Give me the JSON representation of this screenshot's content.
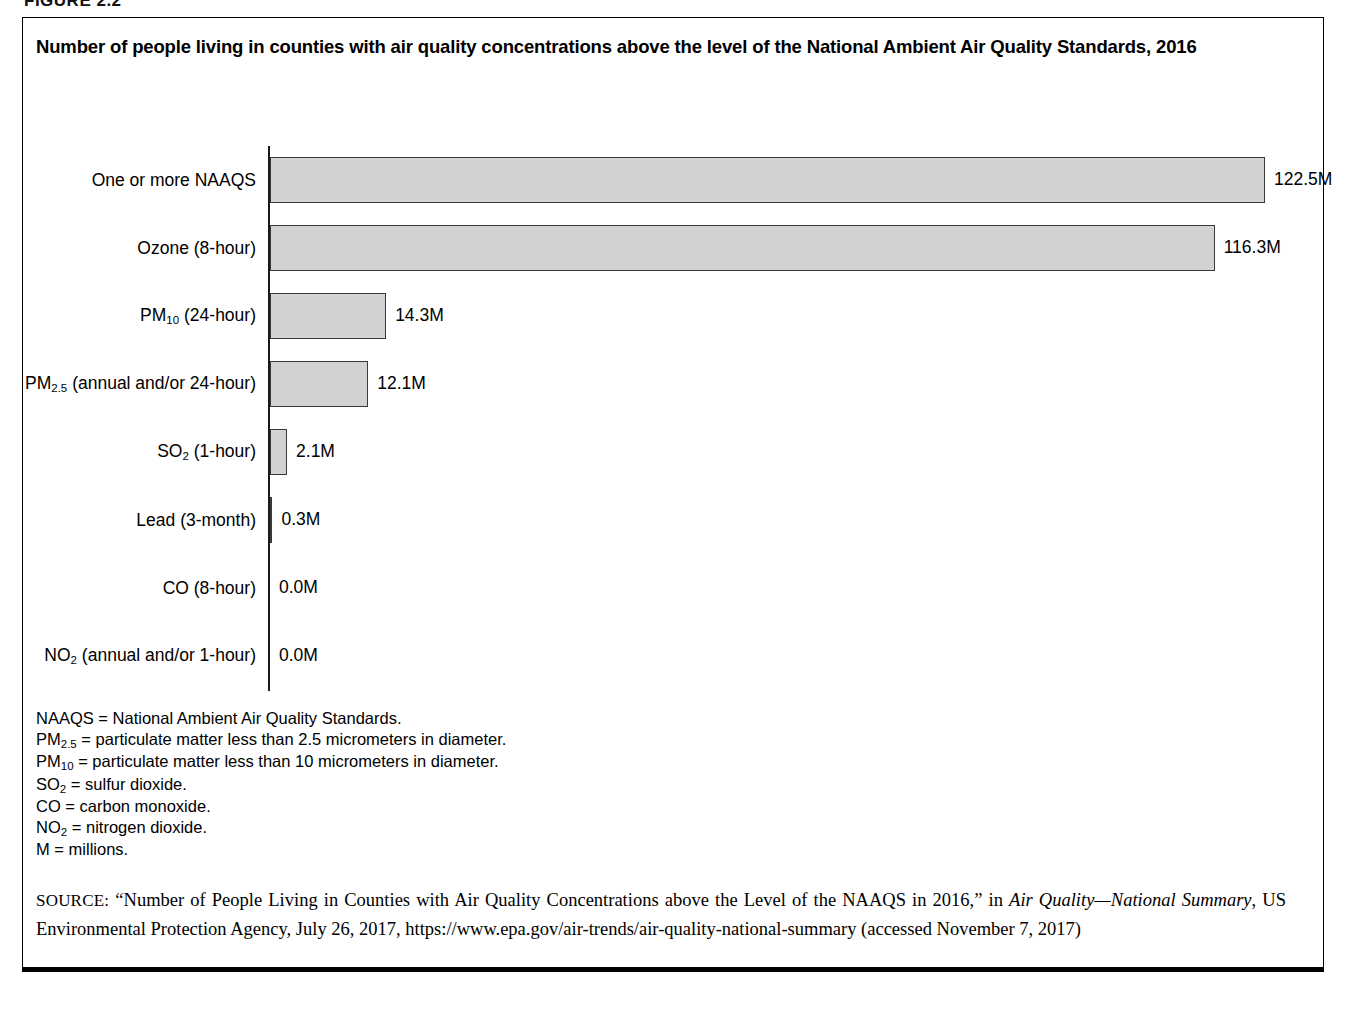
{
  "figure": {
    "caption": "FIGURE 2.2"
  },
  "chart_title": "Number of people living in counties with air quality concentrations above the level of the National Ambient Air Quality Standards, 2016",
  "chart_data": {
    "type": "bar",
    "orientation": "horizontal",
    "title": "Number of people living in counties with air quality concentrations above the level of the National Ambient Air Quality Standards, 2016",
    "xlabel": "",
    "ylabel": "",
    "xlim": [
      0,
      122.5
    ],
    "grid": false,
    "legend": "none",
    "unit": "millions of people",
    "categories": [
      "One or more NAAQS",
      "Ozone (8-hour)",
      "PM10 (24-hour)",
      "PM2.5 (annual and/or 24-hour)",
      "SO2 (1-hour)",
      "Lead (3-month)",
      "CO (8-hour)",
      "NO2 (annual and/or 1-hour)"
    ],
    "values": [
      122.5,
      116.3,
      14.3,
      12.1,
      2.1,
      0.3,
      0.0,
      0.0
    ],
    "value_labels": [
      "122.5M",
      "116.3M",
      "14.3M",
      "12.1M",
      "2.1M",
      "0.3M",
      "0.0M",
      "0.0M"
    ],
    "bars": [
      {
        "label_main": "One or more NAAQS",
        "label_sub": "",
        "label_tail": "",
        "value": 122.5,
        "value_label": "122.5M"
      },
      {
        "label_main": "Ozone (8-hour)",
        "label_sub": "",
        "label_tail": "",
        "value": 116.3,
        "value_label": "116.3M"
      },
      {
        "label_main": "PM",
        "label_sub": "10",
        "label_tail": " (24-hour)",
        "value": 14.3,
        "value_label": "14.3M"
      },
      {
        "label_main": "PM",
        "label_sub": "2.5",
        "label_tail": " (annual and/or 24-hour)",
        "value": 12.1,
        "value_label": "12.1M"
      },
      {
        "label_main": "SO",
        "label_sub": "2",
        "label_tail": " (1-hour)",
        "value": 2.1,
        "value_label": "2.1M"
      },
      {
        "label_main": "Lead (3-month)",
        "label_sub": "",
        "label_tail": "",
        "value": 0.3,
        "value_label": "0.3M"
      },
      {
        "label_main": "CO (8-hour)",
        "label_sub": "",
        "label_tail": "",
        "value": 0.0,
        "value_label": "0.0M"
      },
      {
        "label_main": "NO",
        "label_sub": "2",
        "label_tail": " (annual and/or 1-hour)",
        "value": 0.0,
        "value_label": "0.0M"
      }
    ],
    "colors": {
      "bar_fill": "#d2d2d2",
      "bar_stroke": "#3a3a3a",
      "axis": "#1a1a1a",
      "text": "#000000",
      "background": "#ffffff"
    }
  },
  "notes": [
    {
      "main": "NAAQS",
      "sub": "",
      "tail": " = National Ambient Air Quality Standards."
    },
    {
      "main": "PM",
      "sub": "2.5",
      "tail": " = particulate matter less than 2.5 micrometers in diameter."
    },
    {
      "main": "PM",
      "sub": "10",
      "tail": " = particulate matter less than 10 micrometers in diameter."
    },
    {
      "main": "SO",
      "sub": "2",
      "tail": " = sulfur dioxide."
    },
    {
      "main": "CO",
      "sub": "",
      "tail": " = carbon monoxide."
    },
    {
      "main": "NO",
      "sub": "2",
      "tail": " = nitrogen dioxide."
    },
    {
      "main": "M",
      "sub": "",
      "tail": " = millions."
    }
  ],
  "source": {
    "keyword": "SOURCE:",
    "part1": " “Number of People Living in Counties with Air Quality Concentrations above the Level of the NAAQS in 2016,” in ",
    "italic1": "Air Quality—National Summary",
    "part2": ", US Environmental Protection Agency, July 26, 2017, https://www.epa.gov/air-trends/air-quality-national-summary (accessed November 7, 2017)"
  }
}
